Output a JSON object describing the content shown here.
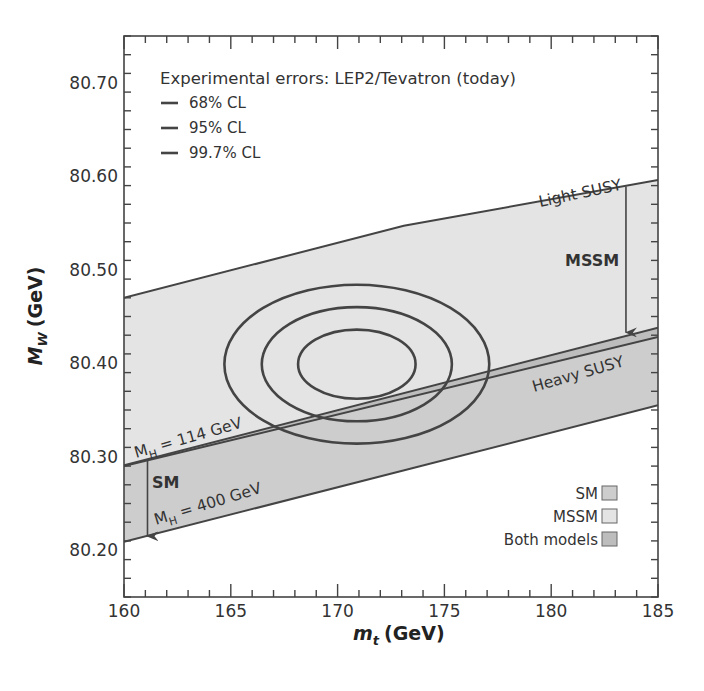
{
  "chart_data": {
    "type": "area",
    "title": "",
    "xlabel": "m",
    "xlabel_sub": "t",
    "xlabel_unit": "(GeV)",
    "ylabel": "M",
    "ylabel_sub": "W",
    "ylabel_unit": "(GeV)",
    "xlim": [
      160,
      185
    ],
    "ylim": [
      80.15,
      80.75
    ],
    "x_ticks": [
      160,
      165,
      170,
      175,
      180,
      185
    ],
    "x_tick_labels": [
      "160",
      "165",
      "170",
      "175",
      "180",
      "185"
    ],
    "x_minor_step": 1,
    "y_ticks": [
      80.2,
      80.3,
      80.4,
      80.5,
      80.6,
      80.7
    ],
    "y_tick_labels": [
      "80.20",
      "80.30",
      "80.40",
      "80.50",
      "80.60",
      "80.70"
    ],
    "y_minor_step": 0.02,
    "grid": false,
    "bands": [
      {
        "name": "MSSM",
        "color": "#e4e4e4",
        "upper": {
          "x": [
            160,
            173.1,
            185
          ],
          "y": [
            80.47,
            80.547,
            80.596
          ]
        },
        "lower": {
          "x": [
            160,
            185
          ],
          "y": [
            80.29,
            80.428
          ]
        }
      },
      {
        "name": "SM",
        "color": "#cdcdcd",
        "upper": {
          "x": [
            160,
            185
          ],
          "y": [
            80.291,
            80.438
          ]
        },
        "lower": {
          "x": [
            160,
            185
          ],
          "y": [
            80.209,
            80.355
          ]
        }
      }
    ],
    "overlap": {
      "name": "Both models",
      "color": "#bdbdbd"
    },
    "ellipses": [
      {
        "name": "68% CL",
        "center": [
          170.9,
          80.399
        ],
        "half_width_mt": 2.75,
        "half_height_mw": 0.037
      },
      {
        "name": "95% CL",
        "center": [
          170.9,
          80.399
        ],
        "half_width_mt": 4.45,
        "half_height_mw": 0.061
      },
      {
        "name": "99.7% CL",
        "center": [
          170.9,
          80.399
        ],
        "half_width_mt": 6.2,
        "half_height_mw": 0.085
      }
    ],
    "arrows": [
      {
        "name": "MSSM",
        "x": 183.5,
        "from": 80.589,
        "to": 80.433
      },
      {
        "name": "SM",
        "x": 161.1,
        "from": 80.297,
        "to": 80.215
      }
    ],
    "annotations": {
      "light_susy": "Light SUSY",
      "heavy_susy": "Heavy SUSY",
      "mssm": "MSSM",
      "sm": "SM",
      "mh114_prefix": "M",
      "mh114_sub": "H",
      "mh114_value": " = 114 GeV",
      "mh400_prefix": "M",
      "mh400_sub": "H",
      "mh400_value": " = 400 GeV"
    },
    "legend_errors": {
      "title": "Experimental errors: LEP2/Tevatron (today)",
      "placement": "top-left",
      "entries": [
        "68% CL",
        "95% CL",
        "99.7% CL"
      ]
    },
    "legend_models": {
      "placement": "bottom-right",
      "entries": [
        {
          "label": "SM",
          "color": "#cdcdcd"
        },
        {
          "label": "MSSM",
          "color": "#e4e4e4"
        },
        {
          "label": "Both models",
          "color": "#bdbdbd"
        }
      ]
    },
    "line_color": "#444444"
  }
}
